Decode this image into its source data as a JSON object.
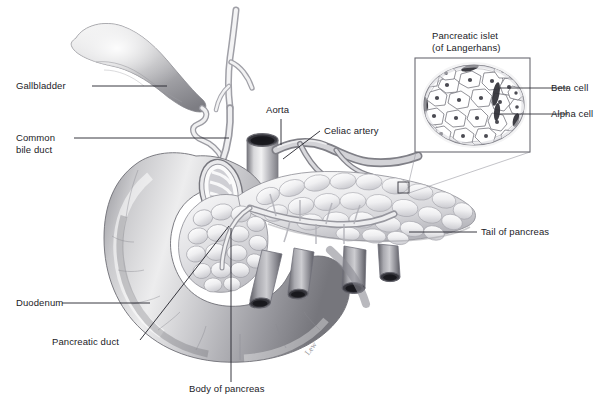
{
  "figure": {
    "background_color": "#ffffff",
    "ink_color": "#1b1b1f",
    "width": 614,
    "height": 418
  },
  "labels": {
    "gallbladder": "Gallbladder",
    "common_bile_duct_line1": "Common",
    "common_bile_duct_line2": "bile duct",
    "aorta": "Aorta",
    "celiac_artery": "Celiac artery",
    "duodenum": "Duodenum",
    "pancreatic_duct": "Pancreatic duct",
    "body_of_pancreas": "Body of pancreas",
    "tail_of_pancreas": "Tail of pancreas"
  },
  "inset": {
    "title_line1": "Pancreatic islet",
    "title_line2": "(of Langerhans)",
    "beta_cell": "Beta cell",
    "alpha_cell": "Alpha cell",
    "cell_count": 26,
    "capillary_count": 7
  },
  "signature": {
    "artist": "Lew"
  }
}
